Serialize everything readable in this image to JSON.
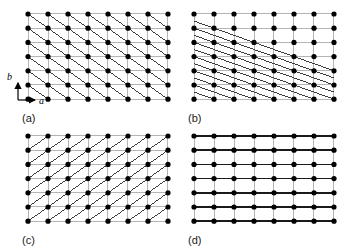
{
  "figure": {
    "background_color": "#ffffff",
    "panel_count": 4,
    "description_type": "crystal-lattice-planes-diagram"
  },
  "lattice": {
    "columns": 8,
    "rows": 7,
    "dx": 20.0,
    "dy": 14.2,
    "dot_radius": 2.6,
    "dot_color": "#000000",
    "grid_line_color": "#b4b4b4",
    "grid_line_width": 1.0,
    "plane_line_color": "#3c3c3c",
    "plane_line_width": 1.0,
    "emphasis_line_color": "#1a1a1a",
    "emphasis_line_width": 1.6
  },
  "axes": {
    "x_label": "a",
    "y_label": "b",
    "arrow_color": "#000000",
    "shown_in_panel": "a"
  },
  "panels": [
    {
      "id": "a",
      "label": "(a)",
      "x": 22,
      "y": 8,
      "plane_family": "negative-45-diagonal",
      "line_step_x": 1,
      "line_step_y": 1,
      "line_direction": "down-right",
      "coverage": "full",
      "show_axes": true,
      "emphasize_horizontals": false
    },
    {
      "id": "b",
      "label": "(b)",
      "x": 188,
      "y": 8,
      "plane_family": "negative-shallow-diagonal",
      "line_step_x": 2,
      "line_step_y": 1,
      "line_direction": "down-right",
      "coverage": "lower-left",
      "show_axes": false,
      "emphasize_horizontals": false
    },
    {
      "id": "c",
      "label": "(c)",
      "x": 22,
      "y": 130,
      "plane_family": "positive-45-diagonal",
      "line_step_x": 1,
      "line_step_y": 1,
      "line_direction": "up-right",
      "coverage": "full",
      "show_axes": false,
      "emphasize_horizontals": false
    },
    {
      "id": "d",
      "label": "(d)",
      "x": 188,
      "y": 130,
      "plane_family": "horizontal",
      "line_step_x": 1,
      "line_step_y": 0,
      "line_direction": "horizontal",
      "coverage": "full",
      "show_axes": false,
      "emphasize_horizontals": true
    }
  ],
  "labels": {
    "a": "(a)",
    "b": "(b)",
    "c": "(c)",
    "d": "(d)"
  },
  "label_positions": [
    {
      "panel": "a",
      "x": 22,
      "y": 112
    },
    {
      "panel": "b",
      "x": 188,
      "y": 112
    },
    {
      "panel": "c",
      "x": 22,
      "y": 234
    },
    {
      "panel": "d",
      "x": 188,
      "y": 234
    }
  ]
}
